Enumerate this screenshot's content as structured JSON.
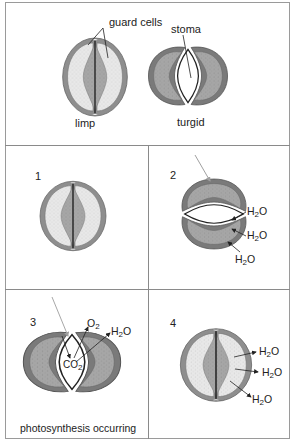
{
  "figure": {
    "top_panel": {
      "labels": {
        "guard_cells": "guard cells",
        "stoma": "stoma",
        "limp": "limp",
        "turgid": "turgid"
      }
    },
    "panels": [
      {
        "number": "1",
        "state": "limp",
        "molecules": []
      },
      {
        "number": "2",
        "state": "turgid",
        "light_arrow": true,
        "molecules": [
          {
            "base": "H",
            "sub": "2",
            "rest": "O",
            "direction": "in"
          },
          {
            "base": "H",
            "sub": "2",
            "rest": "O",
            "direction": "in"
          },
          {
            "base": "H",
            "sub": "2",
            "rest": "O",
            "direction": "in"
          }
        ]
      },
      {
        "number": "3",
        "state": "turgid",
        "light_arrow": true,
        "caption": "photosynthesis occurring",
        "molecules": [
          {
            "base": "O",
            "sub": "2",
            "rest": "",
            "direction": "out"
          },
          {
            "base": "H",
            "sub": "2",
            "rest": "O",
            "direction": "out"
          },
          {
            "base": "CO",
            "sub": "2",
            "rest": "",
            "direction": "in"
          }
        ]
      },
      {
        "number": "4",
        "state": "limp",
        "molecules": [
          {
            "base": "H",
            "sub": "2",
            "rest": "O",
            "direction": "out"
          },
          {
            "base": "H",
            "sub": "2",
            "rest": "O",
            "direction": "out"
          },
          {
            "base": "H",
            "sub": "2",
            "rest": "O",
            "direction": "out"
          }
        ]
      }
    ],
    "colors": {
      "wall": "#8f8f8f",
      "wall_dark": "#6e6e6e",
      "cytoplasm_limp": "#e6e6e6",
      "cytoplasm_turgid": "#a9a9a9",
      "inner_thick": "#9a9a9a",
      "border": "#8a8a8a",
      "light_arrow": "#a8a8a8"
    }
  }
}
